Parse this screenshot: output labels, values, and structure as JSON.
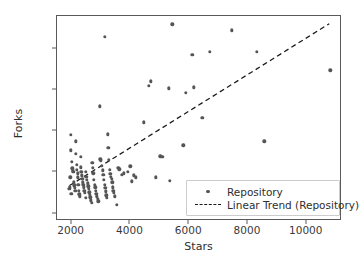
{
  "chart_data": {
    "type": "scatter",
    "title": "",
    "xlabel": "Stars",
    "ylabel": "Forks",
    "xlim": [
      1500,
      11200
    ],
    "ylim": [
      -180,
      4800
    ],
    "xticks": [
      2000,
      4000,
      6000,
      8000,
      10000
    ],
    "xtick_labels": [
      "2000",
      "4000",
      "6000",
      "8000",
      "10000"
    ],
    "yticks": [
      0,
      1000,
      2000,
      3000,
      4000
    ],
    "ytick_labels": [
      "0",
      "1000",
      "2000",
      "3000",
      "4000"
    ],
    "grid": false,
    "legend_position": "lower right",
    "marker_color": "#555555",
    "trend_color": "#1a1a1a",
    "series": [
      {
        "name": "Repository",
        "type": "scatter",
        "marker": "circle",
        "points": [
          [
            1960,
            1910
          ],
          [
            1980,
            1540
          ],
          [
            1950,
            880
          ],
          [
            1930,
            640
          ],
          [
            1920,
            600
          ],
          [
            1990,
            480
          ],
          [
            2010,
            1265
          ],
          [
            2020,
            1100
          ],
          [
            2040,
            1050
          ],
          [
            2060,
            1010
          ],
          [
            2080,
            760
          ],
          [
            2090,
            690
          ],
          [
            2110,
            620
          ],
          [
            2120,
            560
          ],
          [
            2140,
            1760
          ],
          [
            2150,
            1450
          ],
          [
            2170,
            1180
          ],
          [
            2180,
            1060
          ],
          [
            2200,
            980
          ],
          [
            2210,
            880
          ],
          [
            2230,
            700
          ],
          [
            2240,
            560
          ],
          [
            2260,
            470
          ],
          [
            2280,
            420
          ],
          [
            2300,
            1380
          ],
          [
            2320,
            1120
          ],
          [
            2330,
            1010
          ],
          [
            2350,
            930
          ],
          [
            2360,
            840
          ],
          [
            2380,
            760
          ],
          [
            2400,
            700
          ],
          [
            2410,
            640
          ],
          [
            2430,
            560
          ],
          [
            2450,
            500
          ],
          [
            2470,
            380
          ],
          [
            2480,
            1010
          ],
          [
            2500,
            890
          ],
          [
            2520,
            820
          ],
          [
            2540,
            740
          ],
          [
            2560,
            660
          ],
          [
            2580,
            600
          ],
          [
            2600,
            520
          ],
          [
            2620,
            460
          ],
          [
            2640,
            400
          ],
          [
            2660,
            320
          ],
          [
            2680,
            260
          ],
          [
            2700,
            1230
          ],
          [
            2720,
            1110
          ],
          [
            2740,
            980
          ],
          [
            2760,
            820
          ],
          [
            2780,
            700
          ],
          [
            2800,
            640
          ],
          [
            2820,
            560
          ],
          [
            2840,
            480
          ],
          [
            2860,
            420
          ],
          [
            2880,
            360
          ],
          [
            2900,
            300
          ],
          [
            2950,
            2610
          ],
          [
            2980,
            1320
          ],
          [
            3000,
            1290
          ],
          [
            3020,
            1160
          ],
          [
            3050,
            1050
          ],
          [
            3080,
            940
          ],
          [
            3100,
            820
          ],
          [
            3120,
            700
          ],
          [
            3140,
            620
          ],
          [
            3160,
            540
          ],
          [
            3180,
            440
          ],
          [
            3200,
            380
          ],
          [
            3120,
            4290
          ],
          [
            3230,
            1930
          ],
          [
            3250,
            1600
          ],
          [
            3270,
            1310
          ],
          [
            3300,
            1060
          ],
          [
            3320,
            960
          ],
          [
            3340,
            900
          ],
          [
            3360,
            840
          ],
          [
            3380,
            760
          ],
          [
            3400,
            640
          ],
          [
            3420,
            560
          ],
          [
            3440,
            500
          ],
          [
            3460,
            420
          ],
          [
            3530,
            220
          ],
          [
            3580,
            1110
          ],
          [
            3620,
            1080
          ],
          [
            3700,
            940
          ],
          [
            3780,
            980
          ],
          [
            3900,
            1010
          ],
          [
            4000,
            1150
          ],
          [
            4050,
            780
          ],
          [
            4120,
            930
          ],
          [
            4180,
            880
          ],
          [
            4450,
            2220
          ],
          [
            4620,
            3110
          ],
          [
            4700,
            3210
          ],
          [
            4870,
            880
          ],
          [
            5020,
            1390
          ],
          [
            5080,
            1380
          ],
          [
            5300,
            3040
          ],
          [
            5340,
            790
          ],
          [
            5420,
            4600
          ],
          [
            5800,
            1660
          ],
          [
            5880,
            2930
          ],
          [
            6100,
            3860
          ],
          [
            6150,
            3070
          ],
          [
            6450,
            2330
          ],
          [
            6700,
            3930
          ],
          [
            7450,
            4450
          ],
          [
            8300,
            3930
          ],
          [
            8560,
            1760
          ],
          [
            10800,
            3480
          ]
        ]
      },
      {
        "name": "Linear Trend (Repository)",
        "type": "line",
        "style": "dashed",
        "endpoints": [
          [
            1930,
            640
          ],
          [
            10830,
            4610
          ]
        ]
      }
    ]
  },
  "legend": {
    "entries": [
      {
        "label": "Repository",
        "key": "scatter-marker"
      },
      {
        "label": "Linear Trend (Repository)",
        "key": "dashed-line"
      }
    ]
  }
}
